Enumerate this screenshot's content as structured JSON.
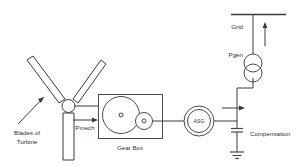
{
  "diagram": {
    "background_color": "#ffffff",
    "line_color": "#3a3a3a",
    "text_color": "#2f2f2f",
    "labels": {
      "blades_line1": "Blades of",
      "blades_line2": "Turbine",
      "pmech": "Pmech",
      "gearbox": "Gear Box",
      "generator": "ASG",
      "compensation": "Compensation",
      "pgen": "Pgen",
      "grid": "Grid"
    },
    "components": [
      {
        "name": "turbine-rotor",
        "label": "Blades of Turbine",
        "blades": 3
      },
      {
        "name": "gear-box",
        "label": "Gear Box",
        "wheels": 2
      },
      {
        "name": "asynchronous-generator",
        "label": "ASG"
      },
      {
        "name": "compensation-capacitor",
        "label": "Compensation"
      },
      {
        "name": "step-up-transformer",
        "label": "Pgen"
      },
      {
        "name": "grid-busbar",
        "label": "Grid"
      }
    ],
    "flows": [
      {
        "name": "mechanical-power",
        "label": "Pmech",
        "direction": "right"
      },
      {
        "name": "generated-power",
        "label": "Pgen",
        "direction": "up"
      }
    ]
  }
}
